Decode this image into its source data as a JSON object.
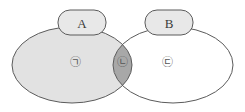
{
  "figure": {
    "type": "venn-diagram",
    "background_color": "#ffffff",
    "outline_color": "#5b5b5b",
    "width": 245,
    "height": 112
  },
  "sets": [
    {
      "id": "set-a",
      "label": "A",
      "position": "left",
      "fill_color": "#e2e2e2",
      "callout_box": {
        "label": "A",
        "fill_color": "#e8e8e8",
        "border_color": "#5b5b5b"
      }
    },
    {
      "id": "set-b",
      "label": "B",
      "position": "right",
      "fill_color": "#ffffff",
      "callout_box": {
        "label": "B",
        "fill_color": "#e8e8e8",
        "border_color": "#5b5b5b"
      }
    }
  ],
  "regions": [
    {
      "id": "region-a-only",
      "label": "㉠",
      "description": "A only",
      "fill_color": "#e2e2e2"
    },
    {
      "id": "region-intersection",
      "label": "㉡",
      "description": "A intersect B",
      "fill_color": "#a8a8a8"
    },
    {
      "id": "region-b-only",
      "label": "㉢",
      "description": "B only",
      "fill_color": "#ffffff"
    }
  ]
}
